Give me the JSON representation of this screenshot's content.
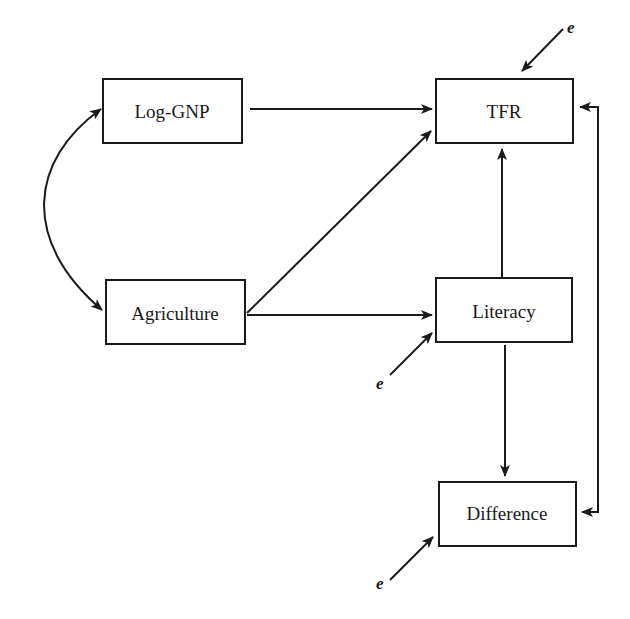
{
  "diagram": {
    "type": "path-diagram",
    "nodes": [
      {
        "id": "loggnp",
        "label": "Log-GNP"
      },
      {
        "id": "tfr",
        "label": "TFR"
      },
      {
        "id": "agriculture",
        "label": "Agriculture"
      },
      {
        "id": "literacy",
        "label": "Literacy"
      },
      {
        "id": "difference",
        "label": "Difference"
      }
    ],
    "edges": [
      {
        "from": "loggnp",
        "to": "tfr",
        "kind": "directed"
      },
      {
        "from": "agriculture",
        "to": "tfr",
        "kind": "directed"
      },
      {
        "from": "agriculture",
        "to": "literacy",
        "kind": "directed"
      },
      {
        "from": "literacy",
        "to": "tfr",
        "kind": "directed"
      },
      {
        "from": "literacy",
        "to": "difference",
        "kind": "directed"
      },
      {
        "from": "difference",
        "to": "tfr",
        "kind": "bidirectional"
      },
      {
        "from": "loggnp",
        "to": "agriculture",
        "kind": "correlation"
      }
    ],
    "error_terms": [
      {
        "target": "tfr",
        "label": "e"
      },
      {
        "target": "literacy",
        "label": "e"
      },
      {
        "target": "difference",
        "label": "e"
      }
    ]
  }
}
